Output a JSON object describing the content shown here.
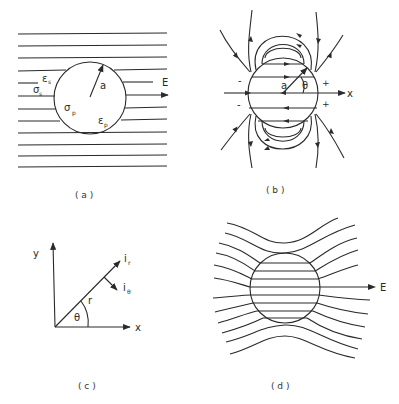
{
  "panels": {
    "a": {
      "caption": "( a )",
      "labels": {
        "eps_s": "ε",
        "eps_s_sub": "s",
        "sigma_s": "σ",
        "sigma_s_sub": "s",
        "sigma_p": "σ",
        "sigma_p_sub": "p",
        "eps_p": "ε",
        "eps_p_sub": "p",
        "radius": "a",
        "field": "E"
      }
    },
    "b": {
      "caption": "( b )",
      "labels": {
        "radius": "a",
        "angle": "θ",
        "axis": "x",
        "minus_top": "-",
        "minus_bottom": "-",
        "plus_top": "+",
        "plus_bottom": "+"
      }
    },
    "c": {
      "caption": "( c )",
      "labels": {
        "y_axis": "y",
        "x_axis": "x",
        "radius": "r",
        "angle": "θ",
        "unit_r": "i",
        "unit_r_sub": "r",
        "unit_theta": "i",
        "unit_theta_sub": "θ"
      }
    },
    "d": {
      "caption": "( d )",
      "labels": {
        "field": "E"
      }
    }
  },
  "colors": {
    "ink": "#2a2a2a",
    "background": "#ffffff"
  }
}
